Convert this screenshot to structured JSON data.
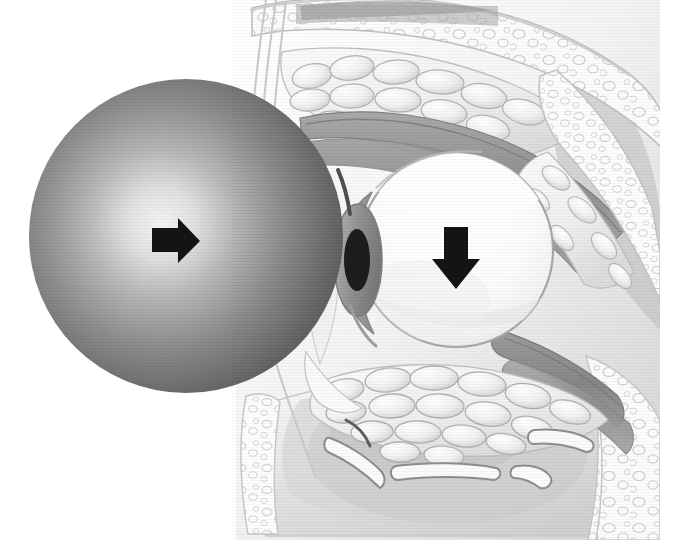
{
  "figure": {
    "background_color": "#ffffff",
    "width": 681,
    "height": 540
  },
  "palette": {
    "background": "#ffffff",
    "ball_rim": "#595959",
    "ball_mid": "#8a8a8a",
    "ball_highlight": "#f2f2f2",
    "globe_white": "#fdfdfd",
    "globe_shade": "#e4e4e4",
    "sclera_outline": "#9a9a9a",
    "cornea_iris": "#8f8f8f",
    "pupil": "#1d1d1d",
    "muscle_gray": "#9b9b9b",
    "muscle_dark": "#7d7d7d",
    "bone_fill": "#fbfbfb",
    "bone_outline": "#b9b9b9",
    "marrow_outline": "#cfcfcf",
    "fat_fill": "#f4f4f4",
    "fat_outline": "#b2b2b2",
    "sinus_fill": "#ededed",
    "sinus_shadow": "#d6d6d6",
    "skin_line": "#c4c4c4",
    "arrow_black": "#141414"
  },
  "objects": {
    "impacting_ball": {
      "label": "impacting spherical object",
      "center_x": 186,
      "center_y": 236,
      "radius": 157,
      "highlight_x": 160,
      "highlight_y": 225,
      "shading": "radial-gradient light center to dark rim"
    },
    "globe": {
      "label": "eyeball globe",
      "center_x": 456,
      "center_y": 250,
      "radius_x": 97,
      "radius_y": 97
    },
    "cornea": {
      "label": "cornea and anterior chamber",
      "center_x": 352,
      "center_y": 258
    },
    "iris": {
      "label": "iris",
      "center_x": 355,
      "center_y": 258
    },
    "pupil": {
      "label": "pupil",
      "center_x": 357,
      "center_y": 260,
      "radius_x": 13,
      "radius_y": 31
    }
  },
  "arrows": [
    {
      "name": "impact-force-arrow",
      "direction": "right",
      "meaning": "direction of impacting force on the globe",
      "x": 152,
      "y": 222,
      "width": 48,
      "height": 38,
      "color": "#141414"
    },
    {
      "name": "globe-displacement-arrow",
      "direction": "down",
      "meaning": "downward displacement of the globe into the fracture",
      "x": 434,
      "y": 227,
      "width": 46,
      "height": 62,
      "color": "#141414"
    }
  ],
  "anatomy": [
    {
      "name": "frontal-bone",
      "label": "Frontal bone (superior orbital rim)",
      "region": "top"
    },
    {
      "name": "bone-marrow-trabeculae",
      "label": "Cancellous bone marrow",
      "region": "top"
    },
    {
      "name": "superior-rectus-muscle",
      "label": "Superior rectus / levator muscle complex",
      "region": "upper"
    },
    {
      "name": "superior-orbital-fat",
      "label": "Superior orbital fat pad",
      "region": "upper"
    },
    {
      "name": "inferior-rectus-muscle",
      "label": "Inferior rectus muscle",
      "region": "lower"
    },
    {
      "name": "inferior-orbital-fat",
      "label": "Inferior orbital fat herniating through fracture",
      "region": "lower"
    },
    {
      "name": "orbital-floor-fracture",
      "label": "Orbital floor blowout fracture",
      "region": "lower"
    },
    {
      "name": "bone-fragments",
      "label": "Displaced bone fragments",
      "region": "lower",
      "count": 4
    },
    {
      "name": "maxillary-sinus",
      "label": "Maxillary sinus cavity",
      "region": "lower"
    },
    {
      "name": "eyelid-skin-profile",
      "label": "Anterior eyelid and skin profile",
      "region": "left"
    },
    {
      "name": "lateral-orbital-wall",
      "label": "Posterior orbital wall",
      "region": "right"
    }
  ],
  "bone_fragments": [
    {
      "id": 1,
      "x": 352,
      "y": 448,
      "angle": 28
    },
    {
      "id": 2,
      "x": 443,
      "y": 470,
      "angle": -6
    },
    {
      "id": 3,
      "x": 546,
      "y": 440,
      "angle": -14
    },
    {
      "id": 4,
      "x": 527,
      "y": 474,
      "angle": 22
    }
  ]
}
